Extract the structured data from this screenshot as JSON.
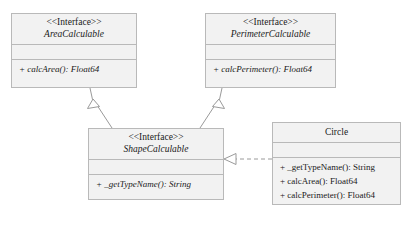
{
  "diagram": {
    "type": "uml-class-diagram",
    "caption": "",
    "stereotype_label": "<<Interface>>",
    "classes": [
      {
        "id": "area-calculable",
        "stereotype": "<<Interface>>",
        "name": "AreaCalculable",
        "name_italic": true,
        "attributes": [],
        "operations": [
          {
            "text": "+ calcArea(): Float64",
            "italic": true
          }
        ],
        "x": 11,
        "y": 13,
        "width": 126,
        "height": 75
      },
      {
        "id": "perimeter-calculable",
        "stereotype": "<<Interface>>",
        "name": "PerimeterCalculable",
        "name_italic": true,
        "attributes": [],
        "operations": [
          {
            "text": "+ calcPerimeter(): Float64",
            "italic": true
          }
        ],
        "x": 205,
        "y": 13,
        "width": 131,
        "height": 75
      },
      {
        "id": "shape-calculable",
        "stereotype": "<<Interface>>",
        "name": "ShapeCalculable",
        "name_italic": true,
        "attributes": [],
        "operations": [
          {
            "text": "+ _getTypeName(): String",
            "italic": true
          }
        ],
        "x": 88,
        "y": 128,
        "width": 136,
        "height": 72
      },
      {
        "id": "circle",
        "stereotype": "",
        "name": "Circle",
        "name_italic": false,
        "attributes": [],
        "operations": [
          {
            "text": "+ _getTypeName(): String",
            "italic": false
          },
          {
            "text": "+ calcArea(): Float64",
            "italic": false
          },
          {
            "text": "+ calcPerimeter(): Float64",
            "italic": false
          }
        ],
        "x": 272,
        "y": 122,
        "width": 129,
        "height": 83
      }
    ],
    "relationships": [
      {
        "id": "shape-extends-area",
        "kind": "generalization",
        "style": "solid",
        "arrow": "hollow-triangle",
        "from": "shape-calculable",
        "to": "area-calculable"
      },
      {
        "id": "shape-extends-perimeter",
        "kind": "generalization",
        "style": "solid",
        "arrow": "hollow-triangle",
        "from": "shape-calculable",
        "to": "perimeter-calculable"
      },
      {
        "id": "circle-realizes-shape",
        "kind": "realization",
        "style": "dashed",
        "arrow": "hollow-triangle",
        "from": "circle",
        "to": "shape-calculable"
      }
    ],
    "colors": {
      "box_fill": "#f2f2f2",
      "box_border": "#b9b9b9",
      "line": "#9a9a9a",
      "text": "#1a1a1a",
      "background": "#ffffff"
    }
  }
}
